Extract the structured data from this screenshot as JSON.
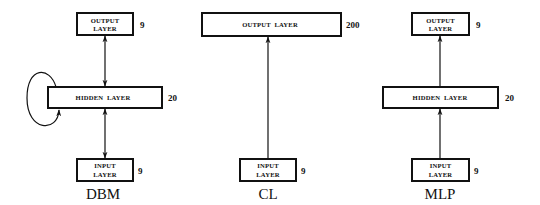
{
  "diagrams": [
    {
      "label": "DBM",
      "output": {
        "line1": "OUTPUT",
        "line2": "LAYER",
        "units": "9"
      },
      "hidden": {
        "text": "HIDDEN  LAYER",
        "units": "20",
        "recurrent": true
      },
      "input": {
        "line1": "INPUT",
        "line2": "LAYER",
        "units": "9"
      },
      "connections": "bidirectional"
    },
    {
      "label": "CL",
      "output": {
        "text": "OUTPUT  LAYER",
        "units": "200"
      },
      "input": {
        "line1": "INPUT",
        "line2": "LAYER",
        "units": "9"
      },
      "connections": "feedforward"
    },
    {
      "label": "MLP",
      "output": {
        "line1": "OUTPUT",
        "line2": "LAYER",
        "units": "9"
      },
      "hidden": {
        "text": "HIDDEN  LAYER",
        "units": "20"
      },
      "input": {
        "line1": "INPUT",
        "line2": "LAYER",
        "units": "9"
      },
      "connections": "feedforward"
    }
  ],
  "colors": {
    "line": "#111111",
    "background": "#ffffff"
  }
}
